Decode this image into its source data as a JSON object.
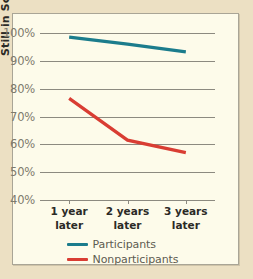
{
  "chart_data": {
    "type": "line",
    "title": "",
    "xlabel": "",
    "ylabel": "Still in School",
    "categories": [
      "1 year\nlater",
      "2 years\nlater",
      "3 years\nlater"
    ],
    "x_tick_lines": [
      [
        "1 year",
        "later"
      ],
      [
        "2 years",
        "later"
      ],
      [
        "3 years",
        "later"
      ]
    ],
    "y_ticks": [
      "100%",
      "90%",
      "80%",
      "70%",
      "60%",
      "50%",
      "40%"
    ],
    "y_tick_values": [
      100,
      90,
      80,
      70,
      60,
      50,
      40
    ],
    "ylim": [
      40,
      100
    ],
    "grid": true,
    "legend_position": "bottom-center",
    "series": [
      {
        "name": "Participants",
        "color": "#1b7c8c",
        "values": [
          98.5,
          96.0,
          93.2
        ]
      },
      {
        "name": "Nonparticipants",
        "color": "#d93d33",
        "values": [
          76.5,
          61.5,
          57.0
        ]
      }
    ]
  },
  "legend": {
    "items": [
      {
        "label": "Participants",
        "color": "#1b7c8c"
      },
      {
        "label": "Nonparticipants",
        "color": "#d93d33"
      }
    ]
  },
  "colors": {
    "page_background": "#ece0c3",
    "panel_background": "#fdfbea",
    "panel_border": "#a9a596",
    "gridline": "#8c8a80",
    "tick_text": "#7d7a6d",
    "label_text": "#2b2a26",
    "legend_text": "#5d5b51"
  }
}
